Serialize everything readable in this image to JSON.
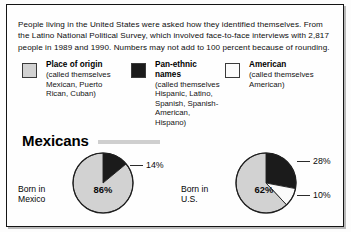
{
  "figure": {
    "intro": "People living in the United States were asked how they identified themselves. From the Latino National Political Survey, which involved face-to-face interviews with 2,817 people in 1989 and 1990. Numbers may not add to 100 percent because of rounding.",
    "group_heading": "Mexicans"
  },
  "legend": {
    "items": [
      {
        "title": "Place of origin",
        "subtitle": "(called themselves Mexican, Puerto Rican, Cuban)",
        "color": "#d2d2d2",
        "swatch_name": "place-of-origin"
      },
      {
        "title": "Pan-ethnic names",
        "subtitle": "(called themselves Hispanic, Latino, Spanish, Spanish-American, Hispano)",
        "color": "#1b1b1b",
        "swatch_name": "pan-ethnic-names"
      },
      {
        "title": "American",
        "subtitle": "(called themselves American)",
        "color": "#fbfbfb",
        "swatch_name": "american"
      }
    ]
  },
  "chart_data": {
    "type": "pie",
    "title": "Mexicans",
    "subtitle": "People living in the United States were asked how they identified themselves.",
    "legend_position": "top",
    "categories": [
      "Place of origin",
      "Pan-ethnic names",
      "American"
    ],
    "colors": [
      "#d2d2d2",
      "#1b1b1b",
      "#fbfbfb"
    ],
    "units": "percent",
    "charts": [
      {
        "label_line1": "Born in",
        "label_line2": "Mexico",
        "center_value": "86%",
        "slices": [
          {
            "category": "Pan-ethnic names",
            "value": 14,
            "label": "14%",
            "color": "#1b1b1b",
            "callout": true
          },
          {
            "category": "Place of origin",
            "value": 86,
            "label": "86%",
            "color": "#d2d2d2",
            "callout": false
          }
        ]
      },
      {
        "label_line1": "Born in",
        "label_line2": "U.S.",
        "center_value": "62%",
        "slices": [
          {
            "category": "Pan-ethnic names",
            "value": 28,
            "label": "28%",
            "color": "#1b1b1b",
            "callout": true
          },
          {
            "category": "American",
            "value": 10,
            "label": "10%",
            "color": "#fbfbfb",
            "callout": true
          },
          {
            "category": "Place of origin",
            "value": 62,
            "label": "62%",
            "color": "#d2d2d2",
            "callout": false
          }
        ]
      }
    ]
  }
}
